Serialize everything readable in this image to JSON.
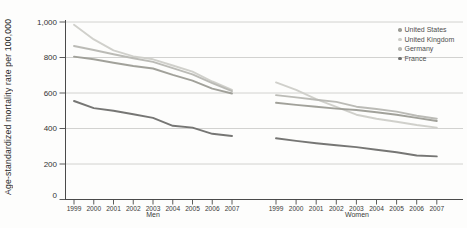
{
  "chart_data": {
    "type": "line",
    "title": "",
    "ylabel": "Age-standardized mortality rate per 100,000",
    "xlabel": "",
    "ylim": [
      0,
      1000
    ],
    "yticks": [
      0,
      200,
      400,
      600,
      800,
      1000
    ],
    "ytick_labels": [
      "0",
      "200",
      "400",
      "600",
      "800",
      "1,000"
    ],
    "grid": true,
    "legend_position": "top-right",
    "x": [
      1999,
      2000,
      2001,
      2002,
      2003,
      2004,
      2005,
      2006,
      2007
    ],
    "panels": [
      {
        "label": "Men",
        "series": [
          {
            "name": "United States",
            "color": "#9c9c95",
            "values": [
              805,
              790,
              770,
              752,
              738,
              702,
              670,
              625,
              597
            ]
          },
          {
            "name": "United Kingdom",
            "color": "#cdcdc8",
            "values": [
              985,
              902,
              840,
              806,
              790,
              755,
              720,
              665,
              618
            ]
          },
          {
            "name": "Germany",
            "color": "#b7b7b2",
            "values": [
              865,
              842,
              818,
              796,
              775,
              740,
              705,
              655,
              610
            ]
          },
          {
            "name": "France",
            "color": "#6f6f6d",
            "values": [
              555,
              515,
              500,
              480,
              460,
              415,
              405,
              370,
              358
            ]
          }
        ]
      },
      {
        "label": "Women",
        "series": [
          {
            "name": "United States",
            "color": "#9c9c95",
            "values": [
              545,
              533,
              522,
              512,
              504,
              492,
              478,
              460,
              442
            ]
          },
          {
            "name": "United Kingdom",
            "color": "#cdcdc8",
            "values": [
              660,
              618,
              565,
              522,
              478,
              455,
              438,
              420,
              405
            ]
          },
          {
            "name": "Germany",
            "color": "#b7b7b2",
            "values": [
              588,
              575,
              562,
              550,
              523,
              510,
              495,
              472,
              455
            ]
          },
          {
            "name": "France",
            "color": "#6f6f6d",
            "values": [
              345,
              330,
              317,
              306,
              295,
              280,
              266,
              248,
              243
            ]
          }
        ]
      }
    ],
    "legend": [
      {
        "label": "United States",
        "color": "#9c9c95"
      },
      {
        "label": "United Kingdom",
        "color": "#cdcdc8"
      },
      {
        "label": "Germany",
        "color": "#b7b7b2"
      },
      {
        "label": "France",
        "color": "#6f6f6d"
      }
    ],
    "axis_color": "#4a4a4a",
    "gridline_color": "#c7c7c4",
    "tick_label_color": "#333333"
  }
}
